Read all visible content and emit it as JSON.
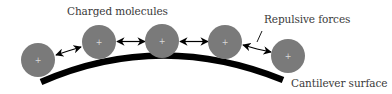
{
  "diagram": {
    "labels": {
      "molecules": "Charged molecules",
      "forces": "Repulsive forces",
      "surface": "Cantilever surface"
    },
    "charge_symbol": "+",
    "colors": {
      "molecule_fill": "#7a7a7a",
      "surface": "#000000",
      "arrow": "#000000",
      "text": "#3a3a3a",
      "plus": "#d8d8d8"
    },
    "molecules": [
      {
        "cx": 38,
        "cy": 60,
        "r": 17
      },
      {
        "cx": 99,
        "cy": 42,
        "r": 17
      },
      {
        "cx": 162,
        "cy": 41,
        "r": 17
      },
      {
        "cx": 225,
        "cy": 42,
        "r": 17
      },
      {
        "cx": 288,
        "cy": 56,
        "r": 17
      }
    ]
  }
}
